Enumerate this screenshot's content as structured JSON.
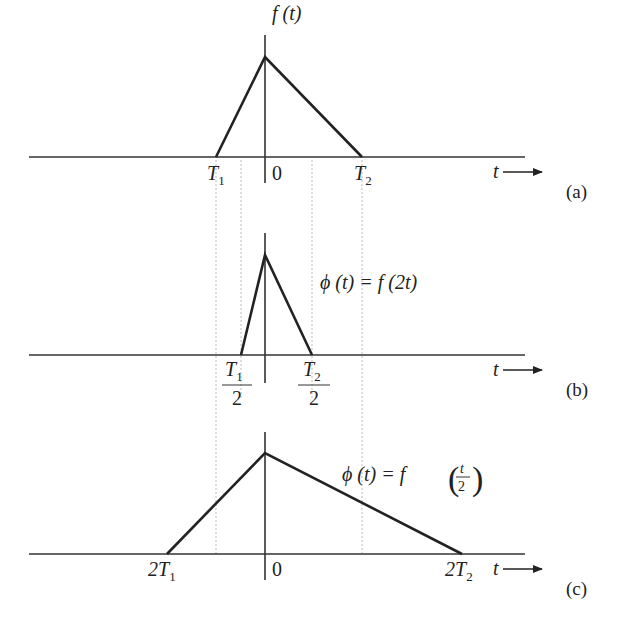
{
  "panels": {
    "a": {
      "func_label": "f (t)",
      "ticks": {
        "left": "T",
        "left_sub": "1",
        "zero": "0",
        "right": "T",
        "right_sub": "2"
      },
      "axis_label": "t",
      "panel_label": "(a)"
    },
    "b": {
      "equation": "ϕ (t)  =  f (2t)",
      "ticks": {
        "left_num": "T",
        "left_sub": "1",
        "left_den": "2",
        "right_num": "T",
        "right_sub": "2",
        "right_den": "2"
      },
      "axis_label": "t",
      "panel_label": "(b)"
    },
    "c": {
      "equation_lhs": "ϕ (t)  =  f",
      "equation_num": "t",
      "equation_den": "2",
      "ticks": {
        "left": "2T",
        "left_sub": "1",
        "zero": "0",
        "right": "2T",
        "right_sub": "2"
      },
      "axis_label": "t",
      "panel_label": "(c)"
    }
  }
}
